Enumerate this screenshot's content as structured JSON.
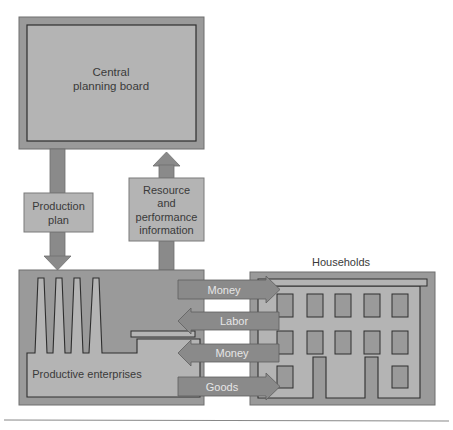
{
  "diagram": {
    "colors": {
      "outer_box": "#9a9a9a",
      "inner_fill": "#b4b4b4",
      "arrow": "#8a8a8a",
      "line": "#2e2e2e",
      "footer_rule": "#888888"
    },
    "central_board": {
      "line1": "Central",
      "line2": "planning board"
    },
    "production_plan": {
      "line1": "Production",
      "line2": "plan"
    },
    "resource_info": {
      "line1": "Resource",
      "line2": "and",
      "line3": "performance",
      "line4": "information"
    },
    "enterprises": {
      "label": "Productive enterprises"
    },
    "households": {
      "label": "Households"
    },
    "flows": [
      {
        "label": "Money",
        "direction": "right"
      },
      {
        "label": "Labor",
        "direction": "left"
      },
      {
        "label": "Money",
        "direction": "left"
      },
      {
        "label": "Goods",
        "direction": "right"
      }
    ]
  }
}
